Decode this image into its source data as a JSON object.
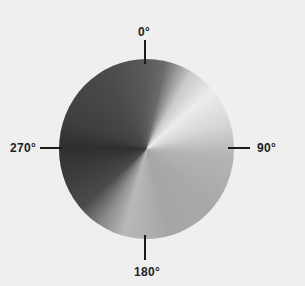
{
  "diagram": {
    "type": "conic-gradient-angle-wheel",
    "background_color": "#efefef",
    "labels": {
      "top": "0°",
      "right": "90°",
      "bottom": "180°",
      "left": "270°"
    },
    "gradient_stops": [
      {
        "angle": 0,
        "color": "#5a5a5a"
      },
      {
        "angle": 48,
        "color": "#ececec"
      },
      {
        "angle": 95,
        "color": "#b4b4b4"
      },
      {
        "angle": 165,
        "color": "#a6a6a6"
      },
      {
        "angle": 195,
        "color": "#b9b9b9"
      },
      {
        "angle": 228,
        "color": "#4a4a4a"
      },
      {
        "angle": 272,
        "color": "#2f2f2f"
      },
      {
        "angle": 360,
        "color": "#5a5a5a"
      }
    ]
  }
}
